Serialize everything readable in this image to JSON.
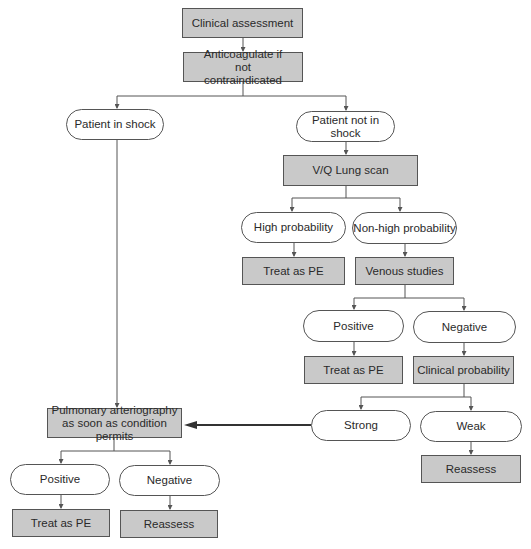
{
  "colors": {
    "box_fill": "#c9c9c9",
    "stroke": "#555555",
    "pill_fill": "#ffffff",
    "text": "#2a2a2a"
  },
  "nodes": {
    "clinical_assessment": "Clinical assessment",
    "anticoagulate": "Anticoagulate if not contraindicated",
    "patient_in_shock": "Patient in shock",
    "patient_not_in_shock": "Patient not in shock",
    "vq_scan": "V/Q Lung scan",
    "high_probability": "High probability",
    "non_high_probability": "Non-high probability",
    "treat_pe_1": "Treat as PE",
    "venous_studies": "Venous studies",
    "venous_positive": "Positive",
    "venous_negative": "Negative",
    "treat_pe_2": "Treat as PE",
    "clinical_probability": "Clinical probability",
    "strong": "Strong",
    "weak": "Weak",
    "reassess_1": "Reassess",
    "pulmonary_arteriography": "Pulmonary arteriography as soon as condition permits",
    "arterio_positive": "Positive",
    "arterio_negative": "Negative",
    "treat_pe_3": "Treat as PE",
    "reassess_2": "Reassess"
  }
}
